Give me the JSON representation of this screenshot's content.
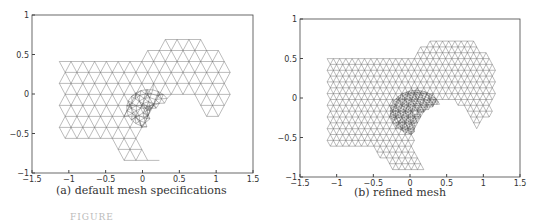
{
  "panels": [
    {
      "id": "a",
      "caption": "(a) default mesh specifications",
      "mesh_density": "coarse",
      "xlim": [
        -1.5,
        1.5
      ],
      "ylim": [
        -1,
        1
      ],
      "xticks": [
        "-1.5",
        "-1",
        "-0.5",
        "0",
        "0.5",
        "1",
        "1.5"
      ],
      "yticks": [
        "-1",
        "-0.5",
        "0",
        "0.5",
        "1"
      ]
    },
    {
      "id": "b",
      "caption": "(b) refined mesh",
      "mesh_density": "fine",
      "xlim": [
        -1.5,
        1.5
      ],
      "ylim": [
        -1,
        1
      ],
      "xticks": [
        "-1.5",
        "-1",
        "-0.5",
        "0",
        "0.5",
        "1",
        "1.5"
      ],
      "yticks": [
        "-1",
        "-0.5",
        "0",
        "0.5",
        "1"
      ]
    }
  ],
  "figure_caption": "FIGURE",
  "colors": {
    "mesh": "#555555",
    "axes": "#444444"
  }
}
